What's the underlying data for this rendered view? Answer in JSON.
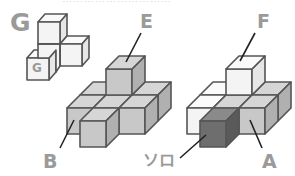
{
  "header": {
    "cut_text": "…………………………"
  },
  "labels": {
    "G_big": "G",
    "G_small": "G",
    "E": "E",
    "F": "F",
    "B": "B",
    "A": "A",
    "solo": "ソロ"
  },
  "colors": {
    "white_face": "#f4f4f4",
    "white_top": "#fafafa",
    "white_side": "#e6e6e6",
    "gray_face": "#c8c8c8",
    "gray_top": "#d6d6d6",
    "gray_side": "#b0b0b0",
    "dark_face": "#6e6e6e",
    "dark_top": "#8a8a8a",
    "dark_side": "#5a5a5a",
    "edge": "#555555",
    "label": "#9a9a9a"
  }
}
